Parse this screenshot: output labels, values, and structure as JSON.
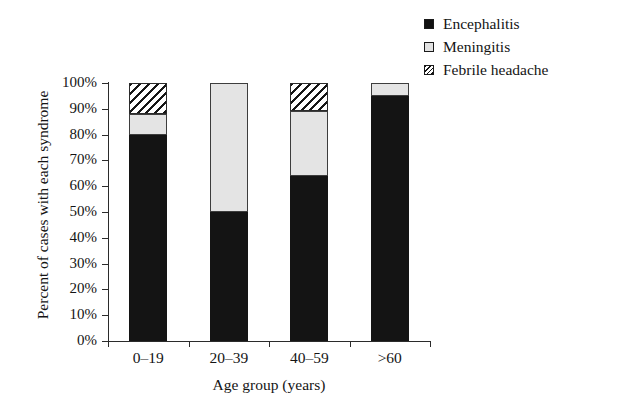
{
  "chart_data": {
    "type": "bar",
    "subtype": "stacked-100-percent",
    "title": "",
    "xlabel": "Age group (years)",
    "ylabel": "Percent of cases with each syndrome",
    "categories": [
      "0–19",
      "20–39",
      "40–59",
      ">60"
    ],
    "series": [
      {
        "name": "Encephalitis",
        "values": [
          80,
          50,
          64,
          95
        ],
        "pattern": "solid-black",
        "color": "#141414"
      },
      {
        "name": "Meningitis",
        "values": [
          8,
          50,
          25,
          5
        ],
        "pattern": "light-gray",
        "color": "#e4e4e4"
      },
      {
        "name": "Febrile headache",
        "values": [
          12,
          0,
          11,
          0
        ],
        "pattern": "diagonal-hatch",
        "color": "#ffffff"
      }
    ],
    "ylim": [
      0,
      100
    ],
    "ytick_labels": [
      "0%",
      "10%",
      "20%",
      "30%",
      "40%",
      "50%",
      "60%",
      "70%",
      "80%",
      "90%",
      "100%"
    ],
    "ytick_values": [
      0,
      10,
      20,
      30,
      40,
      50,
      60,
      70,
      80,
      90,
      100
    ],
    "grid": false,
    "legend_position": "top-right"
  },
  "legend": {
    "items": [
      {
        "label": "Encephalitis",
        "swatch": "solid-black-swatch"
      },
      {
        "label": "Meningitis",
        "swatch": "light-gray-swatch"
      },
      {
        "label": "Febrile headache",
        "swatch": "hatched-swatch"
      }
    ]
  },
  "axes": {
    "y_title": "Percent of cases with each syndrome",
    "x_title": "Age group (years)"
  }
}
